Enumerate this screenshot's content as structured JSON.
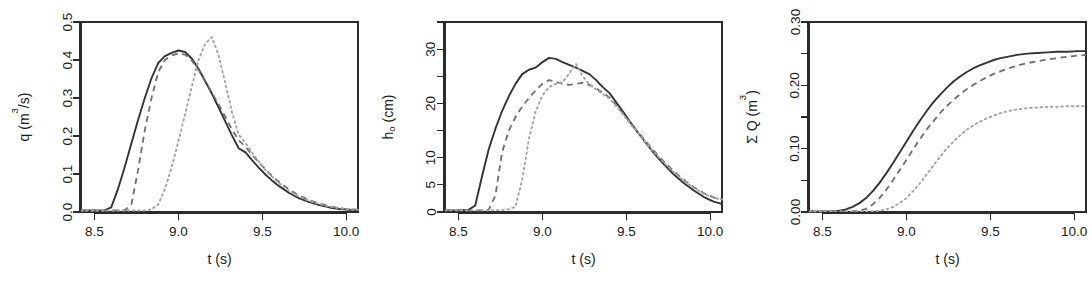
{
  "figure": {
    "background": "#ffffff",
    "panel_count": 3,
    "series_styles": [
      {
        "name": "solid",
        "color": "#343434",
        "dash": "solid"
      },
      {
        "name": "dashed",
        "color": "#6f6f6f",
        "dash": "dashed"
      },
      {
        "name": "dotted",
        "color": "#a3a3a3",
        "dash": "dotted"
      }
    ]
  },
  "chart_data": [
    {
      "type": "line",
      "panel": "left",
      "title": "",
      "xlabel": "t (s)",
      "ylabel": "q (m3/s)",
      "ylabel_parts": {
        "prefix": "q (m",
        "sup": "3",
        "suffix": "/s)"
      },
      "xlim": [
        8.42,
        10.07
      ],
      "ylim": [
        0.0,
        0.5
      ],
      "grid": false,
      "legend": "none",
      "xticks": [
        8.5,
        9.0,
        9.5,
        10.0
      ],
      "xticklabels": [
        "8.5",
        "9.0",
        "9.5",
        "10.0"
      ],
      "yticks": [
        0.0,
        0.1,
        0.2,
        0.3,
        0.4,
        0.5
      ],
      "yticklabels": [
        "0.0",
        "0.1",
        "0.2",
        "0.3",
        "0.4",
        "0.5"
      ],
      "x": [
        8.42,
        8.5,
        8.56,
        8.6,
        8.64,
        8.68,
        8.72,
        8.76,
        8.8,
        8.84,
        8.88,
        8.92,
        8.96,
        9.0,
        9.04,
        9.08,
        9.12,
        9.16,
        9.2,
        9.24,
        9.28,
        9.32,
        9.36,
        9.4,
        9.44,
        9.48,
        9.52,
        9.56,
        9.6,
        9.66,
        9.72,
        9.78,
        9.84,
        9.9,
        9.96,
        10.02,
        10.07
      ],
      "series": [
        {
          "name": "solid",
          "values": [
            0.004,
            0.004,
            0.004,
            0.012,
            0.06,
            0.118,
            0.18,
            0.242,
            0.3,
            0.352,
            0.392,
            0.41,
            0.419,
            0.425,
            0.421,
            0.404,
            0.377,
            0.344,
            0.311,
            0.275,
            0.238,
            0.201,
            0.167,
            0.157,
            0.136,
            0.116,
            0.098,
            0.082,
            0.068,
            0.05,
            0.036,
            0.026,
            0.018,
            0.012,
            0.008,
            0.006,
            0.005
          ]
        },
        {
          "name": "dashed",
          "values": [
            0.004,
            0.004,
            0.004,
            0.004,
            0.004,
            0.004,
            0.02,
            0.11,
            0.215,
            0.3,
            0.368,
            0.4,
            0.412,
            0.417,
            0.414,
            0.399,
            0.374,
            0.344,
            0.314,
            0.283,
            0.25,
            0.217,
            0.188,
            0.172,
            0.15,
            0.13,
            0.112,
            0.094,
            0.079,
            0.059,
            0.043,
            0.031,
            0.022,
            0.015,
            0.01,
            0.007,
            0.006
          ]
        },
        {
          "name": "dotted",
          "values": [
            0.004,
            0.004,
            0.004,
            0.004,
            0.004,
            0.004,
            0.004,
            0.004,
            0.004,
            0.007,
            0.02,
            0.06,
            0.118,
            0.185,
            0.258,
            0.33,
            0.4,
            0.443,
            0.46,
            0.412,
            0.338,
            0.262,
            0.203,
            0.182,
            0.156,
            0.132,
            0.11,
            0.092,
            0.076,
            0.055,
            0.04,
            0.029,
            0.021,
            0.014,
            0.01,
            0.007,
            0.006
          ]
        }
      ]
    },
    {
      "type": "line",
      "panel": "middle",
      "title": "",
      "xlabel": "t (s)",
      "ylabel": "ho (cm)",
      "ylabel_parts": {
        "prefix": "h",
        "sub": "o",
        "suffix": " (cm)"
      },
      "xlim": [
        8.42,
        10.07
      ],
      "ylim": [
        0,
        35
      ],
      "grid": false,
      "legend": "none",
      "xticks": [
        8.5,
        9.0,
        9.5,
        10.0
      ],
      "xticklabels": [
        "8.5",
        "9.0",
        "9.5",
        "10.0"
      ],
      "yticks": [
        0,
        5,
        10,
        15,
        20,
        25,
        30,
        35
      ],
      "yticklabels": [
        "0",
        "5",
        "10",
        "",
        "20",
        "",
        "30",
        ""
      ],
      "x": [
        8.42,
        8.5,
        8.56,
        8.6,
        8.64,
        8.68,
        8.72,
        8.76,
        8.8,
        8.84,
        8.88,
        8.92,
        8.96,
        9.0,
        9.04,
        9.08,
        9.12,
        9.16,
        9.2,
        9.24,
        9.28,
        9.32,
        9.36,
        9.4,
        9.44,
        9.48,
        9.52,
        9.56,
        9.6,
        9.66,
        9.72,
        9.78,
        9.84,
        9.9,
        9.96,
        10.02,
        10.07
      ],
      "series": [
        {
          "name": "solid",
          "values": [
            0.3,
            0.3,
            0.4,
            1.2,
            6.5,
            11.5,
            15.3,
            18.6,
            21.3,
            23.6,
            25.4,
            26.2,
            26.6,
            27.6,
            28.4,
            28.2,
            27.6,
            27.1,
            26.6,
            26.0,
            25.4,
            24.3,
            23.0,
            21.9,
            20.2,
            18.5,
            16.7,
            15.0,
            13.4,
            11.0,
            8.9,
            7.0,
            5.4,
            4.0,
            2.8,
            1.9,
            1.5
          ]
        },
        {
          "name": "dashed",
          "values": [
            0.3,
            0.3,
            0.3,
            0.3,
            0.3,
            0.4,
            3.0,
            11.0,
            15.0,
            17.5,
            19.4,
            21.0,
            22.4,
            23.6,
            24.3,
            24.0,
            23.6,
            23.4,
            23.6,
            23.8,
            23.4,
            22.8,
            21.9,
            21.1,
            19.7,
            18.2,
            16.6,
            15.1,
            13.6,
            11.4,
            9.4,
            7.6,
            6.0,
            4.6,
            3.5,
            2.7,
            2.4
          ]
        },
        {
          "name": "dotted",
          "values": [
            0.3,
            0.3,
            0.3,
            0.3,
            0.3,
            0.3,
            0.3,
            0.4,
            0.5,
            1.0,
            6.0,
            13.5,
            18.5,
            21.5,
            23.0,
            23.6,
            23.9,
            25.5,
            27.3,
            25.0,
            23.5,
            22.6,
            21.7,
            20.9,
            19.5,
            18.0,
            16.4,
            14.9,
            13.4,
            11.2,
            9.2,
            7.4,
            5.8,
            4.5,
            3.4,
            2.6,
            2.3
          ]
        }
      ]
    },
    {
      "type": "line",
      "panel": "right",
      "title": "",
      "xlabel": "t (s)",
      "ylabel": "SUM Q (m3)",
      "ylabel_parts": {
        "prefix": "Σ Q (m",
        "sup": "3",
        "suffix": ")"
      },
      "xlim": [
        8.42,
        10.07
      ],
      "ylim": [
        0.0,
        0.3
      ],
      "grid": false,
      "legend": "none",
      "xticks": [
        8.5,
        9.0,
        9.5,
        10.0
      ],
      "xticklabels": [
        "8.5",
        "9.0",
        "9.5",
        "10.0"
      ],
      "yticks": [
        0.0,
        0.05,
        0.1,
        0.15,
        0.2,
        0.25,
        0.3
      ],
      "yticklabels": [
        "0.00",
        "",
        "0.10",
        "",
        "0.20",
        "",
        "0.30"
      ],
      "x": [
        8.42,
        8.5,
        8.56,
        8.6,
        8.64,
        8.68,
        8.72,
        8.76,
        8.8,
        8.84,
        8.88,
        8.92,
        8.96,
        9.0,
        9.04,
        9.08,
        9.12,
        9.16,
        9.2,
        9.24,
        9.28,
        9.32,
        9.36,
        9.4,
        9.44,
        9.48,
        9.52,
        9.56,
        9.6,
        9.66,
        9.72,
        9.78,
        9.84,
        9.9,
        9.96,
        10.02,
        10.07
      ],
      "series": [
        {
          "name": "solid",
          "values": [
            0.001,
            0.001,
            0.001,
            0.002,
            0.004,
            0.008,
            0.014,
            0.022,
            0.033,
            0.046,
            0.061,
            0.077,
            0.094,
            0.111,
            0.128,
            0.144,
            0.159,
            0.173,
            0.185,
            0.196,
            0.206,
            0.214,
            0.221,
            0.227,
            0.232,
            0.236,
            0.24,
            0.243,
            0.245,
            0.248,
            0.25,
            0.251,
            0.252,
            0.253,
            0.253,
            0.254,
            0.254
          ]
        },
        {
          "name": "dashed",
          "values": [
            0.001,
            0.001,
            0.001,
            0.001,
            0.001,
            0.001,
            0.002,
            0.005,
            0.012,
            0.022,
            0.035,
            0.05,
            0.066,
            0.082,
            0.099,
            0.115,
            0.13,
            0.143,
            0.156,
            0.167,
            0.177,
            0.186,
            0.194,
            0.201,
            0.207,
            0.213,
            0.218,
            0.222,
            0.226,
            0.231,
            0.235,
            0.238,
            0.241,
            0.243,
            0.245,
            0.247,
            0.248
          ]
        },
        {
          "name": "dotted",
          "values": [
            0.001,
            0.001,
            0.001,
            0.001,
            0.001,
            0.001,
            0.001,
            0.001,
            0.001,
            0.002,
            0.004,
            0.008,
            0.014,
            0.022,
            0.033,
            0.045,
            0.059,
            0.073,
            0.087,
            0.1,
            0.111,
            0.121,
            0.13,
            0.137,
            0.143,
            0.148,
            0.152,
            0.156,
            0.159,
            0.162,
            0.164,
            0.165,
            0.166,
            0.166,
            0.167,
            0.167,
            0.167
          ]
        }
      ]
    }
  ]
}
